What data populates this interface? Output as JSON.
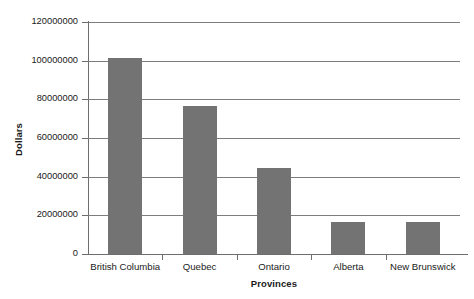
{
  "chart_data": {
    "type": "bar",
    "title": "",
    "xlabel": "Provinces",
    "ylabel": "Dollars",
    "categories": [
      "British Columbia",
      "Quebec",
      "Ontario",
      "Alberta",
      "New Brunswick"
    ],
    "values": [
      101500000,
      76500000,
      44500000,
      16500000,
      16500000
    ],
    "series": [
      {
        "name": "Dollars",
        "values": [
          101500000,
          76500000,
          44500000,
          16500000,
          16500000
        ]
      }
    ],
    "ylim": [
      0,
      120000000
    ],
    "yticks": [
      0,
      20000000,
      40000000,
      60000000,
      80000000,
      100000000,
      120000000
    ],
    "ytick_labels": [
      "0",
      "20000000",
      "40000000",
      "60000000",
      "80000000",
      "100000000",
      "120000000"
    ],
    "grid": true,
    "grid_axis": "y",
    "legend": false,
    "legend_position": "none",
    "bar_color": "#737373",
    "axis_color": "#6e6e6e",
    "grid_color": "#7d7d7d",
    "background": "#ffffff"
  }
}
